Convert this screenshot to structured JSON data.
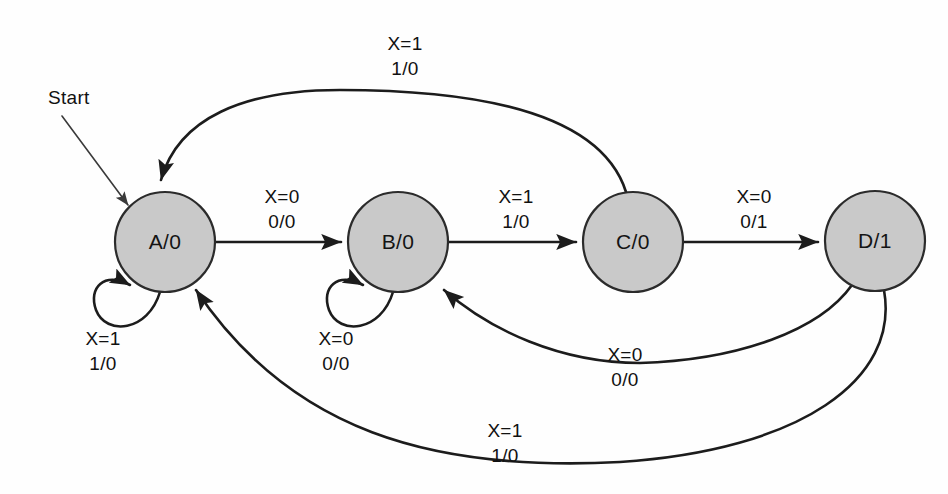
{
  "diagram": {
    "start_marker": {
      "label": "Start",
      "target_state": "A/0"
    },
    "colors": {
      "state_fill": "#c9c9c9",
      "state_stroke": "#2b2b2b",
      "edge_stroke": "#1c1c1c",
      "background": "#fefefe",
      "text": "#111111"
    },
    "states": [
      {
        "id": "A",
        "label": "A/0",
        "cx": 165,
        "cy": 242,
        "r": 50
      },
      {
        "id": "B",
        "label": "B/0",
        "cx": 398,
        "cy": 242,
        "r": 50
      },
      {
        "id": "C",
        "label": "C/0",
        "cx": 633,
        "cy": 242,
        "r": 50
      },
      {
        "id": "D",
        "label": "D/1",
        "cx": 875,
        "cy": 241,
        "r": 50
      }
    ],
    "transitions": [
      {
        "id": "a-to-b",
        "from": "A",
        "to": "B",
        "input": "X=0",
        "output": "0/0",
        "label_x": 282,
        "label_line1_y": 203,
        "label_line2_y": 228
      },
      {
        "id": "b-to-c",
        "from": "B",
        "to": "C",
        "input": "X=1",
        "output": "1/0",
        "label_x": 516,
        "label_line1_y": 203,
        "label_line2_y": 228
      },
      {
        "id": "c-to-d",
        "from": "C",
        "to": "D",
        "input": "X=0",
        "output": "0/1",
        "label_x": 754,
        "label_line1_y": 203,
        "label_line2_y": 228
      },
      {
        "id": "c-to-a",
        "from": "C",
        "to": "A",
        "input": "X=1",
        "output": "1/0",
        "label_x": 405,
        "label_line1_y": 50,
        "label_line2_y": 75
      },
      {
        "id": "a-self",
        "from": "A",
        "to": "A",
        "input": "X=1",
        "output": "1/0",
        "label_x": 103,
        "label_line1_y": 345,
        "label_line2_y": 370
      },
      {
        "id": "b-self",
        "from": "B",
        "to": "B",
        "input": "X=0",
        "output": "0/0",
        "label_x": 336,
        "label_line1_y": 345,
        "label_line2_y": 370
      },
      {
        "id": "d-to-b",
        "from": "D",
        "to": "B",
        "input": "X=0",
        "output": "0/0",
        "label_x": 625,
        "label_line1_y": 361,
        "label_line2_y": 386
      },
      {
        "id": "d-to-a",
        "from": "D",
        "to": "A",
        "input": "X=1",
        "output": "1/0",
        "label_x": 505,
        "label_line1_y": 437,
        "label_line2_y": 462
      }
    ]
  }
}
